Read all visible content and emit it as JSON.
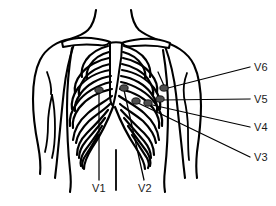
{
  "figure": {
    "line_color": "#000000",
    "background_color": "#ffffff",
    "electrode_color": "#4d4d4d"
  },
  "labels": {
    "v1": "V1",
    "v2": "V2",
    "v3": "V3",
    "v4": "V4",
    "v5": "V5",
    "v6": "V6"
  },
  "electrodes": [
    {
      "id": "V1",
      "label": "V1",
      "x": 99,
      "y": 90,
      "label_x": 92,
      "label_y": 192,
      "side": "right-of-sternum"
    },
    {
      "id": "V2",
      "label": "V2",
      "x": 124,
      "y": 88,
      "label_x": 138,
      "label_y": 192,
      "side": "left-of-sternum"
    },
    {
      "id": "V3",
      "label": "V3",
      "x": 136,
      "y": 101,
      "label_x": 254,
      "label_y": 161,
      "side": "left-chest"
    },
    {
      "id": "V4",
      "label": "V4",
      "x": 148,
      "y": 103,
      "label_x": 254,
      "label_y": 131,
      "side": "left-chest"
    },
    {
      "id": "V5",
      "label": "V5",
      "x": 160,
      "y": 99,
      "label_x": 254,
      "label_y": 103,
      "side": "left-axillary"
    },
    {
      "id": "V6",
      "label": "V6",
      "x": 164,
      "y": 88,
      "label_x": 254,
      "label_y": 71,
      "side": "mid-axillary"
    }
  ]
}
